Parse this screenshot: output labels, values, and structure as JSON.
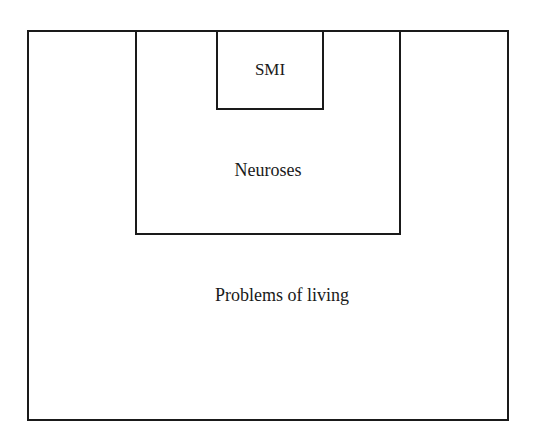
{
  "diagram": {
    "type": "nested-boxes",
    "levels": [
      {
        "id": "outer",
        "label": "Problems of living"
      },
      {
        "id": "middle",
        "label": "Neuroses"
      },
      {
        "id": "inner",
        "label": "SMI"
      }
    ],
    "line_color": "#1a1a1a",
    "background": "#ffffff"
  }
}
